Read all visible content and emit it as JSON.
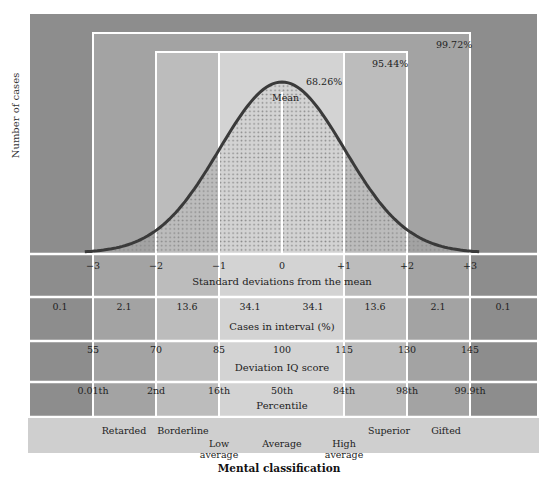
{
  "chart_data": {
    "type": "area",
    "ylabel": "Number of cases",
    "xlabel": "Standard deviations from the mean",
    "x": [
      -3,
      -2,
      -1,
      0,
      1,
      2,
      3
    ],
    "x_tick_labels": [
      "−3",
      "−2",
      "−1",
      "0",
      "+1",
      "+2",
      "+3"
    ],
    "curve": "normal (mean 0, sd 1)",
    "mean_label": "Mean",
    "range_percentages": [
      {
        "range": "±1 SD",
        "label": "68.26%"
      },
      {
        "range": "±2 SD",
        "label": "95.44%"
      },
      {
        "range": "±3 SD",
        "label": "99.72%"
      }
    ],
    "rows": [
      {
        "name": "Cases in interval (%)",
        "intervals": [
          "< -3",
          "-3 to -2",
          "-2 to -1",
          "-1 to 0",
          "0 to +1",
          "+1 to +2",
          "+2 to +3",
          "> +3"
        ],
        "values": [
          0.1,
          2.1,
          13.6,
          34.1,
          34.1,
          13.6,
          2.1,
          0.1
        ]
      },
      {
        "name": "Deviation IQ score",
        "at_sd": [
          -3,
          -2,
          -1,
          0,
          1,
          2,
          3
        ],
        "values": [
          55,
          70,
          85,
          100,
          115,
          130,
          145
        ]
      },
      {
        "name": "Percentile",
        "at_sd": [
          -3,
          -2,
          -1,
          0,
          1,
          2,
          3
        ],
        "values": [
          "0.01th",
          "2nd",
          "16th",
          "50th",
          "84th",
          "98th",
          "99.9th"
        ]
      }
    ],
    "mental_classification": [
      "Retarded",
      "Borderline",
      "Low average",
      "Average",
      "High average",
      "Superior",
      "Gifted"
    ],
    "grid": true,
    "legend": "none"
  },
  "labels": {
    "y_axis": "Number of cases",
    "mean": "Mean",
    "pct_68": "68.26%",
    "pct_95": "95.44%",
    "pct_99": "99.72%",
    "sd_ticks": [
      "−3",
      "−2",
      "−1",
      "0",
      "+1",
      "+2",
      "+3"
    ],
    "sd_title": "Standard deviations from the mean",
    "cases": [
      "0.1",
      "2.1",
      "13.6",
      "34.1",
      "34.1",
      "13.6",
      "2.1",
      "0.1"
    ],
    "cases_title": "Cases in interval (%)",
    "iq": [
      "55",
      "70",
      "85",
      "100",
      "115",
      "130",
      "145"
    ],
    "iq_title": "Deviation IQ score",
    "percentile": [
      "0.01th",
      "2nd",
      "16th",
      "50th",
      "84th",
      "98th",
      "99.9th"
    ],
    "percentile_title": "Percentile",
    "mc": {
      "retarded": "Retarded",
      "borderline": "Borderline",
      "low_average_1": "Low",
      "low_average_2": "average",
      "average": "Average",
      "high_average_1": "High",
      "high_average_2": "average",
      "superior": "Superior",
      "gifted": "Gifted"
    },
    "mc_title": "Mental classification"
  },
  "colors": {
    "outer": "#8d8d8d",
    "band3": "#a3a3a3",
    "band2": "#bcbcbc",
    "band1": "#d3d3d3",
    "bottom_band": "#cfcfcf",
    "curve": "#3a3a3a",
    "grid_line": "#ffffff"
  }
}
